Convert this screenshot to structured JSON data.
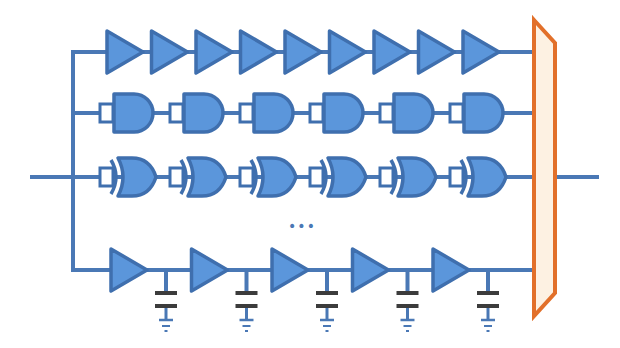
{
  "diagram": {
    "title": "",
    "colors": {
      "wire": "#4a78b5",
      "gate_fill": "#5b96db",
      "gate_stroke": "#3f6fae",
      "mux_stroke": "#e2702a",
      "mux_fill": "#fdf1e2",
      "capacitor": "#3c3c3c"
    },
    "input_wire": {
      "x1": 32,
      "x2": 73,
      "y": 177
    },
    "bus_x": 73,
    "output_wire": {
      "x1": 556,
      "x2": 597,
      "y": 177
    },
    "rows": [
      {
        "name": "buffer-chain",
        "gate_type": "buffer",
        "y": 52,
        "gate_count": 9,
        "start_x": 107,
        "spacing": 44.5,
        "width": 36,
        "height": 42
      },
      {
        "name": "nand-chain",
        "gate_type": "nand",
        "y": 113,
        "gate_count": 6,
        "start_x": 100,
        "spacing": 70,
        "width": 56,
        "height": 38
      },
      {
        "name": "xnor-chain",
        "gate_type": "xnor",
        "y": 177,
        "gate_count": 6,
        "start_x": 100,
        "spacing": 70,
        "width": 56,
        "height": 38
      },
      {
        "name": "rc-buffer-chain",
        "gate_type": "buffer-rc",
        "y": 270,
        "gate_count": 5,
        "start_x": 111,
        "spacing": 80.5,
        "width": 36,
        "height": 42,
        "cap_offset": 55
      }
    ],
    "ellipsis": {
      "label": "•••",
      "x": 302,
      "y": 226
    },
    "mux": {
      "label": "MUX",
      "points": [
        [
          534,
          20
        ],
        [
          555,
          43
        ],
        [
          555,
          293
        ],
        [
          534,
          316
        ]
      ],
      "wire_end_x": 534
    }
  }
}
